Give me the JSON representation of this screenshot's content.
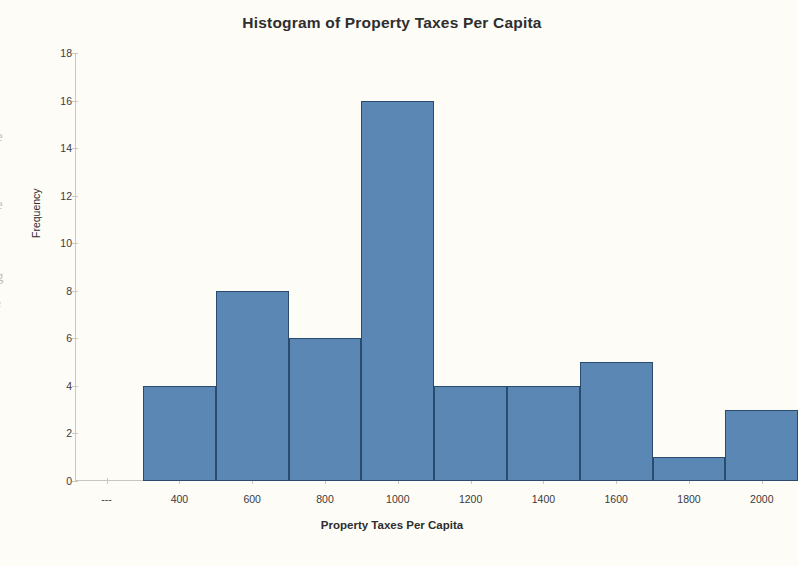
{
  "chart_data": {
    "type": "bar",
    "title": "Histogram of Property Taxes Per Capita",
    "xlabel": "Property Taxes Per Capita",
    "ylabel": "Frequency",
    "grid": false,
    "legend": null,
    "ylim": [
      0,
      18
    ],
    "ytick_labels": [
      "0",
      "2",
      "4",
      "6",
      "8",
      "10",
      "12",
      "14",
      "16",
      "18"
    ],
    "ytick_values": [
      0,
      2,
      4,
      6,
      8,
      10,
      12,
      14,
      16,
      18
    ],
    "xtick_labels": [
      "---",
      "400",
      "600",
      "800",
      "1000",
      "1200",
      "1400",
      "1600",
      "1800",
      "2000"
    ],
    "xtick_values": [
      200,
      400,
      600,
      800,
      1000,
      1200,
      1400,
      1600,
      1800,
      2000
    ],
    "bin_width": 200,
    "categories": [
      "300",
      "500",
      "700",
      "900",
      "1100",
      "1300",
      "1500",
      "1700",
      "1900"
    ],
    "bin_ranges": [
      "200-400",
      "400-600",
      "600-800",
      "800-1000",
      "1000-1200",
      "1200-1400",
      "1400-1600",
      "1600-1800",
      "1800-2000"
    ],
    "values": [
      4,
      8,
      6,
      16,
      4,
      4,
      5,
      1,
      3
    ],
    "colors": {
      "bar_fill": "#5b87b5",
      "bar_border": "#2a4b6e",
      "axis": "#c9c7c2",
      "text": "#2e2e2e",
      "background": "#fdfcf7"
    }
  },
  "edge_artifacts": [
    "t",
    "e",
    "e",
    "g",
    "f"
  ]
}
